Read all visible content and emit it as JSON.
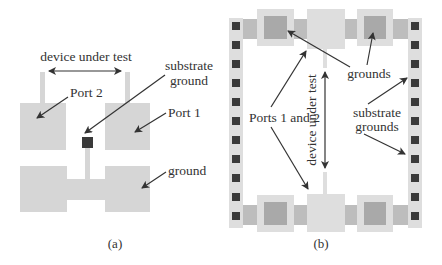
{
  "figure": {
    "panel_a": {
      "caption": "(a)",
      "labels": {
        "device_under_test": "device under test",
        "substrate_ground_line1": "substrate",
        "substrate_ground_line2": "ground",
        "port2": "Port 2",
        "port1": "Port 1",
        "ground": "ground"
      }
    },
    "panel_b": {
      "caption": "(b)",
      "labels": {
        "grounds": "grounds",
        "ports": "Ports 1 and 2",
        "device_under_test": "device under test",
        "substrate_grounds_line1": "substrate",
        "substrate_grounds_line2": "grounds"
      }
    },
    "colors": {
      "pad": "#d6d6d6",
      "pad_dark": "#a9a9a9",
      "via": "#3a3a3a",
      "text": "#333333"
    }
  }
}
